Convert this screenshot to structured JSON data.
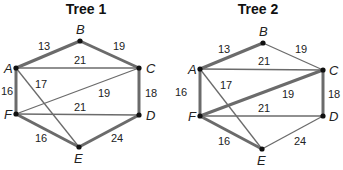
{
  "colors": {
    "edge": "#6b6b6b",
    "node": "#111111",
    "text": "#222222"
  },
  "trees": [
    {
      "title": "Tree 1",
      "offset_x": 0,
      "nodes": {
        "A": {
          "x": 16,
          "y": 68,
          "lx": 4,
          "ly": 73
        },
        "B": {
          "x": 80,
          "y": 41,
          "lx": 76,
          "ly": 34
        },
        "C": {
          "x": 139,
          "y": 68,
          "lx": 146,
          "ly": 73
        },
        "D": {
          "x": 139,
          "y": 115,
          "lx": 146,
          "ly": 120
        },
        "E": {
          "x": 79,
          "y": 147,
          "lx": 74,
          "ly": 163
        },
        "F": {
          "x": 16,
          "y": 114,
          "lx": 4,
          "ly": 119
        }
      },
      "edges": [
        {
          "from": "A",
          "to": "B",
          "weight": "13",
          "thick": true,
          "wx": 38,
          "wy": 50
        },
        {
          "from": "B",
          "to": "C",
          "weight": "19",
          "thick": true,
          "wx": 113,
          "wy": 50
        },
        {
          "from": "A",
          "to": "C",
          "weight": "21",
          "thick": false,
          "wx": 74,
          "wy": 64
        },
        {
          "from": "A",
          "to": "F",
          "weight": "16",
          "thick": true,
          "wx": 1,
          "wy": 95
        },
        {
          "from": "A",
          "to": "E",
          "weight": "17",
          "thick": false,
          "wx": 35,
          "wy": 88
        },
        {
          "from": "F",
          "to": "C",
          "weight": "19",
          "thick": false,
          "wx": 98,
          "wy": 97
        },
        {
          "from": "C",
          "to": "D",
          "weight": "18",
          "thick": true,
          "wx": 145,
          "wy": 97
        },
        {
          "from": "F",
          "to": "D",
          "weight": "21",
          "thick": false,
          "wx": 74,
          "wy": 111
        },
        {
          "from": "F",
          "to": "E",
          "weight": "16",
          "thick": true,
          "wx": 35,
          "wy": 142
        },
        {
          "from": "E",
          "to": "D",
          "weight": "24",
          "thick": true,
          "wx": 111,
          "wy": 142
        }
      ]
    },
    {
      "title": "Tree 2",
      "offset_x": 172,
      "nodes": {
        "A": {
          "x": 28,
          "y": 69,
          "lx": 16,
          "ly": 74
        },
        "B": {
          "x": 91,
          "y": 43,
          "lx": 87,
          "ly": 36
        },
        "C": {
          "x": 151,
          "y": 70,
          "lx": 157,
          "ly": 75
        },
        "D": {
          "x": 151,
          "y": 116,
          "lx": 157,
          "ly": 121
        },
        "E": {
          "x": 90,
          "y": 149,
          "lx": 85,
          "ly": 165
        },
        "F": {
          "x": 28,
          "y": 116,
          "lx": 16,
          "ly": 121
        }
      },
      "edges": [
        {
          "from": "A",
          "to": "B",
          "weight": "13",
          "thick": true,
          "wx": 46,
          "wy": 53
        },
        {
          "from": "B",
          "to": "C",
          "weight": "19",
          "thick": false,
          "wx": 123,
          "wy": 53
        },
        {
          "from": "A",
          "to": "C",
          "weight": "21",
          "thick": false,
          "wx": 86,
          "wy": 65
        },
        {
          "from": "A",
          "to": "F",
          "weight": "16",
          "thick": true,
          "wx": 3,
          "wy": 96
        },
        {
          "from": "A",
          "to": "E",
          "weight": "17",
          "thick": false,
          "wx": 48,
          "wy": 89
        },
        {
          "from": "F",
          "to": "C",
          "weight": "19",
          "thick": true,
          "wx": 110,
          "wy": 98
        },
        {
          "from": "C",
          "to": "D",
          "weight": "18",
          "thick": true,
          "wx": 156,
          "wy": 98
        },
        {
          "from": "F",
          "to": "D",
          "weight": "21",
          "thick": false,
          "wx": 86,
          "wy": 112
        },
        {
          "from": "F",
          "to": "E",
          "weight": "16",
          "thick": true,
          "wx": 46,
          "wy": 145
        },
        {
          "from": "E",
          "to": "D",
          "weight": "24",
          "thick": false,
          "wx": 122,
          "wy": 145
        }
      ]
    }
  ]
}
